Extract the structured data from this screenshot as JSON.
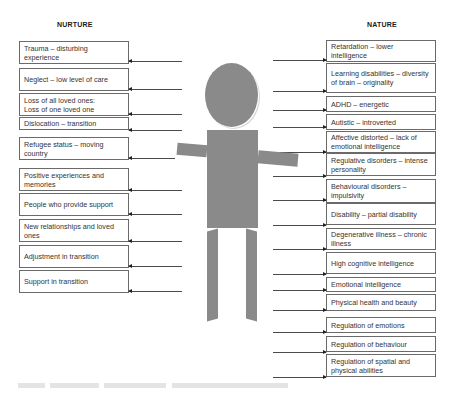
{
  "headings": {
    "left": "NURTURE",
    "right": "NATURE"
  },
  "nurture_items": [
    "Trauma – disturbing experience",
    "Neglect – low level of care",
    "Loss of all loved ones:\nLoss of one loved one",
    "Dislocation – transition",
    "Refugee status – moving country",
    "Positive experiences and memories",
    "People who provide support",
    "New relationships and loved ones",
    "Adjustment in transition",
    "Support in transition"
  ],
  "nature_items": [
    "Retardation – lower intelligence",
    "Learning disabilities – diversity of brain – originality",
    "ADHD – energetic",
    "Autistic – introverted",
    "Affective distorted – lack of emotional intelligence",
    "Regulative disorders – intense personality",
    "Behavioural disorders – impulsivity",
    "Disability – partial disability",
    "Degenerative illness – chronic illness",
    "High cognitive intelligence",
    "Emotional intelligence",
    "Physical health and beauty",
    "Regulation of emotions",
    "Regulation of behaviour",
    "Regulation of spatial and physical abilities"
  ],
  "figure": {
    "fill_color": "#8a8a8a"
  }
}
